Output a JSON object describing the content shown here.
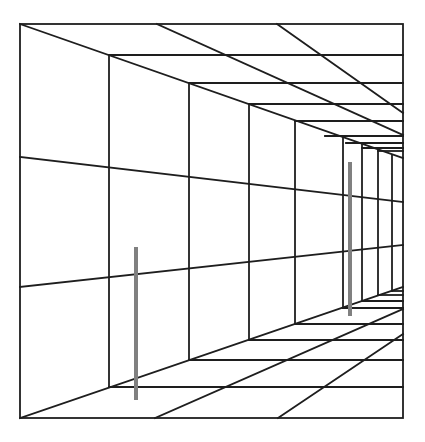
{
  "figure": {
    "colors": {
      "background": "#ffffff",
      "lines": "#1e1e1e",
      "bars": "#808080"
    },
    "frame": {
      "x1": 20,
      "y1": 24,
      "x2": 403,
      "y2": 418
    },
    "bars": [
      {
        "name": "near-bar",
        "x": 136,
        "y1": 247,
        "y2": 400
      },
      {
        "name": "far-bar",
        "x": 350,
        "y1": 162,
        "y2": 316
      }
    ]
  }
}
